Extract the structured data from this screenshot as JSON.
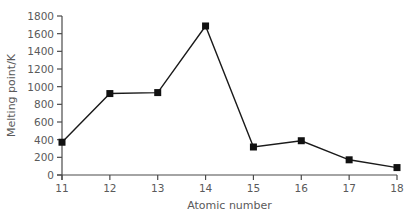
{
  "chart_data": {
    "type": "line",
    "title": "",
    "xlabel": "Atomic number",
    "ylabel": "Melting point/K",
    "x": [
      11,
      12,
      13,
      14,
      15,
      16,
      17,
      18
    ],
    "series": [
      {
        "name": "Melting point",
        "values": [
          371,
          922,
          933,
          1687,
          317,
          388,
          172,
          84
        ]
      }
    ],
    "xlim": [
      11,
      18
    ],
    "ylim": [
      0,
      1800
    ],
    "xticks": [
      "11",
      "12",
      "13",
      "14",
      "15",
      "16",
      "17",
      "18"
    ],
    "yticks": [
      "0",
      "200",
      "400",
      "600",
      "800",
      "1000",
      "1200",
      "1400",
      "1600",
      "1800"
    ],
    "grid": false,
    "legend": "none",
    "marker": "square",
    "line_color": "#1a1a1a"
  }
}
